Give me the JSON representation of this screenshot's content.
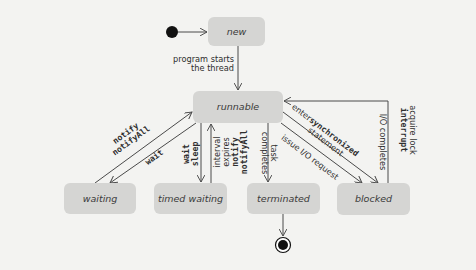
{
  "diagram": {
    "type": "UML state machine - Java thread lifecycle",
    "colors": {
      "background": "#f3f3f1",
      "state_fill": "#d5d5d3",
      "line": "#4a4a4a",
      "text": "#2e2e2e"
    },
    "states": {
      "initial": {
        "kind": "initial-pseudostate"
      },
      "new": {
        "label": "new"
      },
      "runnable": {
        "label": "runnable"
      },
      "waiting": {
        "label": "waiting"
      },
      "timed_waiting": {
        "label": "timed waiting"
      },
      "terminated": {
        "label": "terminated"
      },
      "blocked": {
        "label": "blocked"
      },
      "final": {
        "kind": "final-state"
      }
    },
    "transitions": {
      "start": {
        "from": "initial",
        "to": "new"
      },
      "new_to_runnable": {
        "from": "new",
        "to": "runnable",
        "line1": "program starts",
        "line2": "the thread"
      },
      "waiting_to_runnable": {
        "from": "waiting",
        "to": "runnable",
        "line1": "notify",
        "line2": "notifyAll"
      },
      "runnable_to_waiting": {
        "from": "runnable",
        "to": "waiting",
        "line1": "wait"
      },
      "runnable_to_timed": {
        "from": "runnable",
        "to": "timed_waiting",
        "line1": "wait",
        "line2": "sleep"
      },
      "timed_to_runnable": {
        "from": "timed_waiting",
        "to": "runnable",
        "line1": "interval",
        "line2": "expires",
        "line3": "notify",
        "line4": "notifyAll"
      },
      "runnable_to_terminated": {
        "from": "runnable",
        "to": "terminated",
        "line1": "task",
        "line2": "completes"
      },
      "runnable_to_blocked_sync": {
        "from": "runnable",
        "to": "blocked",
        "line1_prefix": "enter ",
        "line1_code": "synchronized",
        "line2": "statement"
      },
      "runnable_to_blocked_io": {
        "from": "runnable",
        "to": "blocked",
        "line1": "issue I/O request"
      },
      "blocked_to_runnable": {
        "from": "blocked",
        "to": "runnable",
        "io": "I/O completes",
        "line1": "acquire lock",
        "line2": "interrupt"
      },
      "terminated_to_final": {
        "from": "terminated",
        "to": "final"
      }
    }
  }
}
